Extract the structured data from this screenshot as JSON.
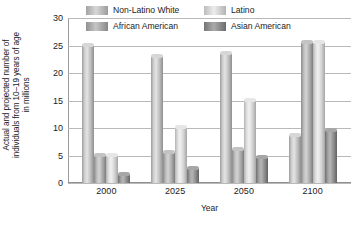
{
  "chart_data": {
    "type": "bar",
    "title": "",
    "xlabel": "Year",
    "ylabel": "Actual and projected number of individuals from 10–19 years of age in millions",
    "ylabel_lines": [
      "Actual and projected number of",
      "individuals from 10–19 years of age",
      "in millions"
    ],
    "categories": [
      "2000",
      "2025",
      "2050",
      "2100"
    ],
    "ylim": [
      0,
      30
    ],
    "yticks": [
      0,
      5,
      10,
      15,
      20,
      25,
      30
    ],
    "ytick_labels": [
      "0",
      "5",
      "10",
      "15",
      "20",
      "25",
      "30"
    ],
    "grid": true,
    "legend_position": "top",
    "series": [
      {
        "name": "Non-Latino White",
        "key": "s0",
        "color": "#cfcfcf",
        "values": [
          25,
          23,
          23.5,
          8.5
        ]
      },
      {
        "name": "African American",
        "key": "s1",
        "color": "#bbbbbb",
        "values": [
          5,
          5.5,
          6,
          25.5
        ]
      },
      {
        "name": "Latino",
        "key": "s2",
        "color": "#e4e4e4",
        "values": [
          5,
          10,
          15,
          25.5
        ]
      },
      {
        "name": "Asian American",
        "key": "s3",
        "color": "#8d8d8d",
        "values": [
          1.5,
          2.5,
          4.5,
          9.5
        ]
      }
    ],
    "legend_entries": [
      {
        "label": "Non-Latino White",
        "key": "s0"
      },
      {
        "label": "Latino",
        "key": "s2"
      },
      {
        "label": "African American",
        "key": "s1"
      },
      {
        "label": "Asian American",
        "key": "s3"
      }
    ]
  }
}
